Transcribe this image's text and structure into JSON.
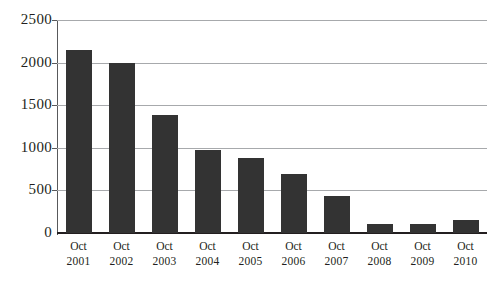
{
  "chart_data": {
    "type": "bar",
    "title": "",
    "subtitle": "",
    "xlabel": "",
    "ylabel": "",
    "categories": [
      "Oct 2001",
      "Oct 2002",
      "Oct 2003",
      "Oct 2004",
      "Oct 2005",
      "Oct 2006",
      "Oct 2007",
      "Oct 2008",
      "Oct 2009",
      "Oct 2010"
    ],
    "category_lines": [
      {
        "month": "Oct",
        "year": "2001"
      },
      {
        "month": "Oct",
        "year": "2002"
      },
      {
        "month": "Oct",
        "year": "2003"
      },
      {
        "month": "Oct",
        "year": "2004"
      },
      {
        "month": "Oct",
        "year": "2005"
      },
      {
        "month": "Oct",
        "year": "2006"
      },
      {
        "month": "Oct",
        "year": "2007"
      },
      {
        "month": "Oct",
        "year": "2008"
      },
      {
        "month": "Oct",
        "year": "2009"
      },
      {
        "month": "Oct",
        "year": "2010"
      }
    ],
    "values": [
      2150,
      2000,
      1380,
      980,
      880,
      690,
      440,
      110,
      110,
      150
    ],
    "ylim": [
      0,
      2500
    ],
    "ytick_values": [
      0,
      500,
      1000,
      1500,
      2000,
      2500
    ],
    "ytick_labels": [
      "0",
      "500",
      "1000",
      "1500",
      "2000",
      "2500"
    ],
    "grid": true,
    "grid_axis": "y",
    "legend": false,
    "legend_position": "none",
    "bar_color": "#333333",
    "gridline_color": "#a7a9ac",
    "axis_color": "#231f20",
    "background_color": "#ffffff"
  }
}
